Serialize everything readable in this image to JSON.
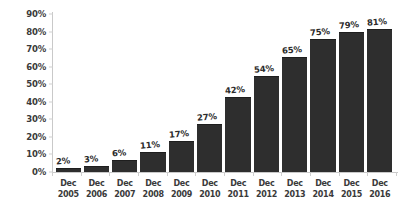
{
  "chart_data": {
    "type": "bar",
    "title": "",
    "subtitle": "",
    "xlabel": "",
    "ylabel": "",
    "ylim": [
      0,
      90
    ],
    "ytick_step": 10,
    "grid": false,
    "legend": null,
    "orientation": "vertical",
    "bar_color": "#2e2e2e",
    "axis_color": "#c9c9c9",
    "background": "#ffffff",
    "value_label_suffix": "%",
    "ytick_labels": [
      "90%",
      "80%",
      "70%",
      "60%",
      "50%",
      "40%",
      "30%",
      "20%",
      "10%",
      "0%"
    ],
    "ytick_values": [
      90,
      80,
      70,
      60,
      50,
      40,
      30,
      20,
      10,
      0
    ],
    "period_prefix": "Dec",
    "categories": [
      "Dec 2005",
      "Dec 2006",
      "Dec 2007",
      "Dec 2008",
      "Dec 2009",
      "Dec 2010",
      "Dec 2011",
      "Dec 2012",
      "Dec 2013",
      "Dec 2014",
      "Dec 2015",
      "Dec 2016"
    ],
    "x_periods": [
      "Dec",
      "Dec",
      "Dec",
      "Dec",
      "Dec",
      "Dec",
      "Dec",
      "Dec",
      "Dec",
      "Dec",
      "Dec",
      "Dec"
    ],
    "x_years": [
      "2005",
      "2006",
      "2007",
      "2008",
      "2009",
      "2010",
      "2011",
      "2012",
      "2013",
      "2014",
      "2015",
      "2016"
    ],
    "values": [
      2,
      3,
      6,
      11,
      17,
      27,
      42,
      54,
      65,
      75,
      79,
      81
    ],
    "value_labels": [
      "2%",
      "3%",
      "6%",
      "11%",
      "17%",
      "27%",
      "42%",
      "54%",
      "65%",
      "75%",
      "79%",
      "81%"
    ]
  }
}
